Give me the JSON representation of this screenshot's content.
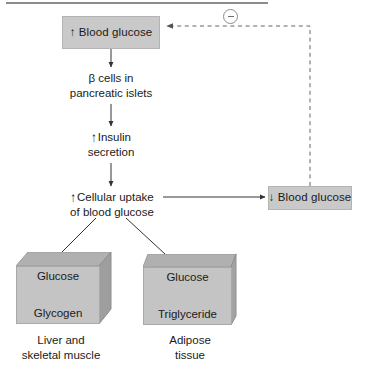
{
  "figure": {
    "background_color": "#ffffff",
    "box_fill_color": "#c9c9c9",
    "cube_fill_color": "#c4c4c4",
    "line_color": "#333333"
  },
  "nodes": {
    "blood_glucose_up": {
      "arrow": "↑",
      "label": "Blood glucose",
      "full_text": "↑ Blood glucose"
    },
    "beta_cells": {
      "line1": "β cells in",
      "line2": "pancreatic islets"
    },
    "insulin_secretion": {
      "arrow": "↑",
      "line1": "Insulin",
      "line2": "secretion"
    },
    "cellular_uptake": {
      "arrow": "↑",
      "line1": "Cellular uptake",
      "line2": "of blood glucose"
    },
    "blood_glucose_down": {
      "arrow": "↓",
      "label": "Blood glucose",
      "full_text": "↓ Blood glucose"
    },
    "liver_cube": {
      "top_text": "Glucose",
      "bottom_text": "Glycogen",
      "caption_line1": "Liver and",
      "caption_line2": "skeletal muscle"
    },
    "adipose_cube": {
      "top_text": "Glucose",
      "bottom_text": "Triglyceride",
      "caption_line1": "Adipose",
      "caption_line2": "tissue"
    }
  },
  "feedback": {
    "sign": "−",
    "sign_name": "negative-feedback-minus",
    "style": "dashed"
  }
}
